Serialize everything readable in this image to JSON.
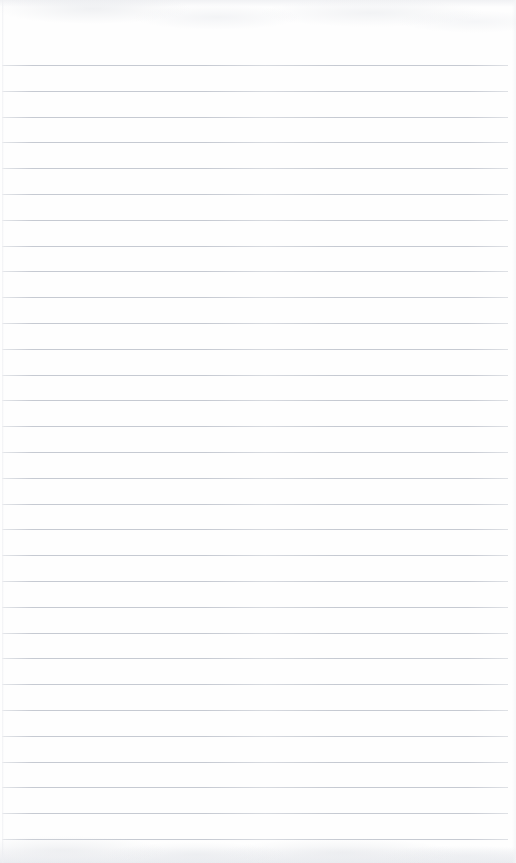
{
  "document": {
    "kind": "scanned-blank-ruled-notepad-page",
    "page_width": 516,
    "page_height": 863,
    "paper_color": "#fefefe",
    "text_content": "",
    "handwriting_present": "no",
    "printed_text_present": "no"
  },
  "ruling": {
    "line_color": "#b9bec8",
    "line_thickness_px": 1,
    "line_spacing_px": 25.8,
    "first_line_y": 65,
    "line_start_x": 2,
    "line_end_x": 508,
    "line_count": 31,
    "margin_rule_present": "no",
    "line_y_positions": [
      65,
      90.8,
      116.6,
      142.4,
      168.2,
      194,
      219.8,
      245.6,
      271.4,
      297.2,
      323,
      348.8,
      374.6,
      400.4,
      426.2,
      452,
      477.8,
      503.6,
      529.4,
      555.2,
      581,
      606.8,
      632.6,
      658.4,
      684.2,
      710,
      735.8,
      761.6,
      787.4,
      813.2,
      839
    ]
  },
  "edges": {
    "top_band_color": "#eeeff2",
    "bottom_band_color": "#e9ebef",
    "left_edge_color": "#eff0f3",
    "right_edge_color": "#f4f5f7"
  }
}
